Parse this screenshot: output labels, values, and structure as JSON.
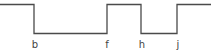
{
  "diagram": {
    "type": "timing-waveform",
    "stroke_color": "#4a4a4a",
    "high_y": 4.5,
    "low_y": 33.5,
    "segments": [
      {
        "from_x": 0,
        "to_x": 34,
        "level": "high"
      },
      {
        "from_x": 34,
        "to_x": 107,
        "level": "low"
      },
      {
        "from_x": 107,
        "to_x": 141,
        "level": "high"
      },
      {
        "from_x": 141,
        "to_x": 177,
        "level": "low"
      },
      {
        "from_x": 177,
        "to_x": 211,
        "level": "high"
      }
    ],
    "labels": [
      {
        "text": "b",
        "x": 35
      },
      {
        "text": "f",
        "x": 107
      },
      {
        "text": "h",
        "x": 142
      },
      {
        "text": "j",
        "x": 178
      }
    ]
  }
}
